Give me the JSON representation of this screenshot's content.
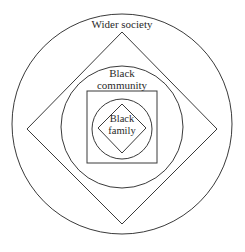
{
  "diagram": {
    "type": "nested-shapes",
    "layers": [
      {
        "id": "wider_society",
        "label": "Wider society",
        "shape": "circle"
      },
      {
        "id": "outer_diamond",
        "label": "",
        "shape": "diamond"
      },
      {
        "id": "black_community",
        "label_lines": [
          "Black",
          "community"
        ],
        "shape": "circle"
      },
      {
        "id": "square",
        "label": "",
        "shape": "square"
      },
      {
        "id": "inner_circle",
        "label": "",
        "shape": "circle"
      },
      {
        "id": "black_family",
        "label_lines": [
          "Black",
          "family"
        ],
        "shape": "diamond"
      }
    ],
    "labels": {
      "wider_society": "Wider society",
      "black_community_1": "Black",
      "black_community_2": "community",
      "black_family_1": "Black",
      "black_family_2": "family"
    },
    "stroke_color": "#3a3a3a",
    "background": "#ffffff"
  }
}
